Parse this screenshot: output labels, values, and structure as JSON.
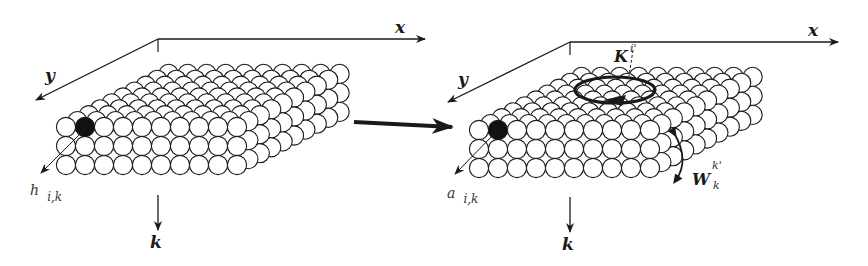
{
  "colors": {
    "ink": "#1a1a1a",
    "circle_fill": "#ffffff",
    "highlight": "#111111",
    "background": "#ffffff"
  },
  "left_panel": {
    "axes": {
      "x": "x",
      "y": "y",
      "k": "k"
    },
    "node_label": {
      "main": "h",
      "sub": "i,k"
    },
    "grid": {
      "rows": 3,
      "cols": 10,
      "depth": 10
    },
    "highlighted_node": {
      "row": 0,
      "col": 1,
      "depth": 0
    }
  },
  "transition_arrow": {
    "direction": "right"
  },
  "right_panel": {
    "axes": {
      "x": "x",
      "y": "y",
      "k": "k"
    },
    "node_label": {
      "main": "a",
      "sub": "i,k"
    },
    "kernel_label": {
      "main": "K",
      "sup": "i'",
      "sub": "i"
    },
    "weight_label": {
      "main": "W",
      "sup": "k'",
      "sub": "k"
    },
    "grid": {
      "rows": 3,
      "cols": 10,
      "depth": 10
    },
    "highlighted_node": {
      "row": 0,
      "col": 1,
      "depth": 0
    }
  }
}
